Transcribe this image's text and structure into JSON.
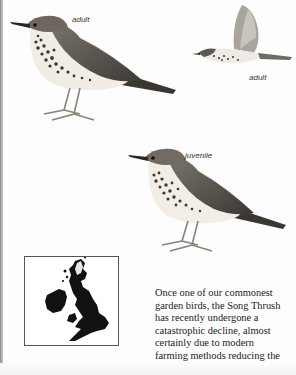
{
  "page": {
    "subject": "Song Thrush",
    "illustrations": [
      {
        "id": "perched-adult",
        "label": "adult"
      },
      {
        "id": "flying-adult",
        "label": "adult"
      },
      {
        "id": "perched-juvenile",
        "label": "juvenile"
      }
    ],
    "map": {
      "description": "distribution map of Britain and Ireland"
    },
    "body_lines": [
      "Once one of our commonest",
      "garden birds, the Song Thrush",
      "has recently undergone a",
      "catastrophic decline, almost",
      "certainly due to modern",
      "farming methods reducing the"
    ],
    "colors": {
      "page": "#fdfdfd",
      "ink": "#222222",
      "map_fill": "#111111",
      "map_highland": "#e6e6e6"
    }
  }
}
